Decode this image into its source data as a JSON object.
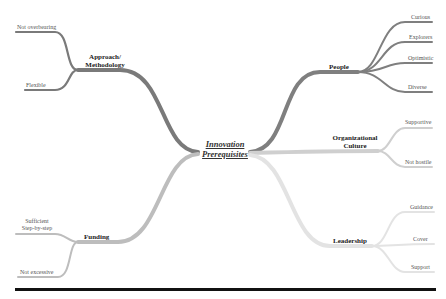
{
  "title": "Innovation Prerequisites",
  "center": {
    "line1": "Innovation",
    "line2": "Prerequisites"
  },
  "branches": {
    "approach": {
      "label_line1": "Approach/",
      "label_line2": "Methodology",
      "color": "#7a7a7a",
      "children": [
        "Not overbearing",
        "Flexible"
      ]
    },
    "people": {
      "label": "People",
      "color": "#7f7f7f",
      "children": [
        "Curious",
        "Explorers",
        "Optimistic",
        "Diverse"
      ]
    },
    "culture": {
      "label_line1": "Organizational",
      "label_line2": "Culture",
      "color": "#cfcfcf",
      "children": [
        "Supportive",
        "Not hostile"
      ]
    },
    "funding": {
      "label": "Funding",
      "color": "#bdbdbd",
      "children_line1": "Sufficient",
      "children_line2": "Step-by-step",
      "children": [
        "Sufficient Step-by-step",
        "Not excessive"
      ]
    },
    "leadership": {
      "label": "Leadership",
      "color": "#e3e3e3",
      "children": [
        "Guidance",
        "Cover",
        "Support"
      ]
    }
  },
  "colors": {
    "approach": "#7a7a7a",
    "people": "#7f7f7f",
    "culture": "#cfcfcf",
    "funding": "#bdbdbd",
    "leadership": "#e3e3e3",
    "rule": "#111111"
  }
}
